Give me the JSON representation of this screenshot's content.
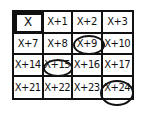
{
  "grid": {
    "rows": [
      [
        {
          "label": "X",
          "circled": false,
          "highlighted_box": true
        },
        {
          "label": "X+1",
          "circled": false
        },
        {
          "label": "X+2",
          "circled": false
        },
        {
          "label": "X+3",
          "circled": false
        }
      ],
      [
        {
          "label": "X+7",
          "circled": false
        },
        {
          "label": "X+8",
          "circled": false
        },
        {
          "label": "X+9",
          "circled": true
        },
        {
          "label": "X+10",
          "circled": false
        }
      ],
      [
        {
          "label": "X+14",
          "circled": false
        },
        {
          "label": "X+15",
          "circled": true
        },
        {
          "label": "X+16",
          "circled": false
        },
        {
          "label": "X+17",
          "circled": false
        }
      ],
      [
        {
          "label": "X+21",
          "circled": false
        },
        {
          "label": "X+22",
          "circled": false
        },
        {
          "label": "X+23",
          "circled": false
        },
        {
          "label": "X+24",
          "circled": true
        }
      ]
    ]
  },
  "colors": {
    "ink": "#111111",
    "background": "#ffffff"
  }
}
